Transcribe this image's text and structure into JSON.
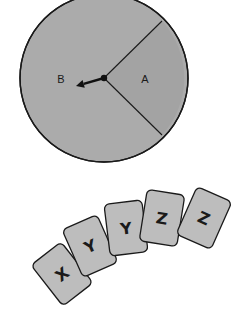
{
  "spinner": {
    "center": [
      104,
      78
    ],
    "radius": 84,
    "fill_b": "#ababab",
    "fill_a": "#a3a3a3",
    "stroke": "#1a1a1a",
    "sector_edge_top": [
      162,
      21
    ],
    "sector_edge_bottom": [
      162,
      135
    ],
    "sectors": [
      {
        "label": "A",
        "x": 145,
        "y": 83
      },
      {
        "label": "B",
        "x": 61,
        "y": 83
      }
    ],
    "pointer": {
      "from": [
        104,
        78
      ],
      "to": [
        76,
        86
      ]
    }
  },
  "cards": {
    "fill": "#bdbdbd",
    "stroke": "#1a1a1a",
    "items": [
      {
        "label": "X",
        "cx": 62,
        "cy": 274,
        "rotate": -38
      },
      {
        "label": "Y",
        "cx": 90,
        "cy": 246,
        "rotate": -24
      },
      {
        "label": "Y",
        "cx": 126,
        "cy": 228,
        "rotate": -7
      },
      {
        "label": "Z",
        "cx": 162,
        "cy": 218,
        "rotate": 9
      },
      {
        "label": "Z",
        "cx": 204,
        "cy": 218,
        "rotate": 24
      }
    ]
  }
}
